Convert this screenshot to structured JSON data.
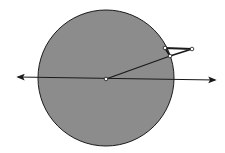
{
  "diagram": {
    "colors": {
      "background": "#ffffff",
      "circle_fill": "#8c8c8c",
      "stroke": "#1a1a1a",
      "point_fill": "#ffffff"
    },
    "circle": {
      "cx": 106,
      "cy": 78,
      "r": 68
    },
    "axis": {
      "x1": 18,
      "y1": 77,
      "x2": 215,
      "y2": 80,
      "arrows": "both"
    },
    "points": [
      {
        "id": "center",
        "x": 106,
        "y": 79
      },
      {
        "id": "rim-lower",
        "x": 170,
        "y": 56
      },
      {
        "id": "rim-upper",
        "x": 165,
        "y": 48
      },
      {
        "id": "outer",
        "x": 192,
        "y": 49
      }
    ],
    "segments": [
      {
        "from": "center",
        "to": "rim-lower"
      },
      {
        "from": "rim-upper",
        "to": "outer"
      },
      {
        "from": "outer",
        "to": "rim-lower"
      },
      {
        "from": "rim-upper",
        "to": "rim-lower"
      }
    ]
  }
}
